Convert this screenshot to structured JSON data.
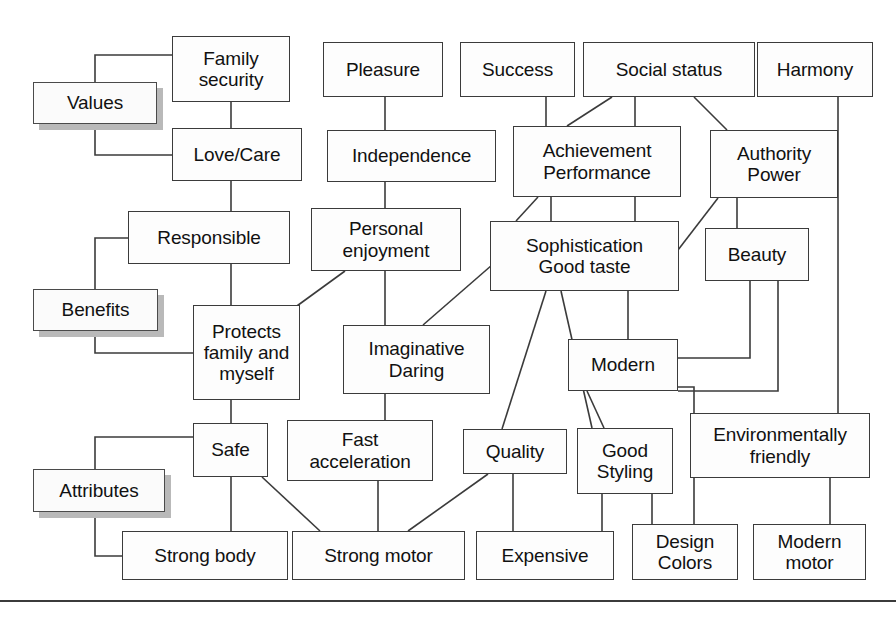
{
  "diagram": {
    "levels": [
      {
        "id": "values",
        "label": "Values",
        "x": 33,
        "y": 82,
        "w": 124,
        "h": 42
      },
      {
        "id": "benefits",
        "label": "Benefits",
        "x": 33,
        "y": 289,
        "w": 125,
        "h": 42
      },
      {
        "id": "attributes",
        "label": "Attributes",
        "x": 33,
        "y": 469,
        "w": 132,
        "h": 43
      }
    ],
    "nodes": [
      {
        "id": "family_security",
        "label": "Family\nsecurity",
        "x": 172,
        "y": 36,
        "w": 118,
        "h": 66
      },
      {
        "id": "pleasure",
        "label": "Pleasure",
        "x": 323,
        "y": 42,
        "w": 120,
        "h": 55
      },
      {
        "id": "success",
        "label": "Success",
        "x": 460,
        "y": 42,
        "w": 115,
        "h": 55
      },
      {
        "id": "social_status",
        "label": "Social status",
        "x": 583,
        "y": 42,
        "w": 172,
        "h": 55
      },
      {
        "id": "harmony",
        "label": "Harmony",
        "x": 757,
        "y": 42,
        "w": 116,
        "h": 55
      },
      {
        "id": "love_care",
        "label": "Love/Care",
        "x": 172,
        "y": 128,
        "w": 130,
        "h": 53
      },
      {
        "id": "independence",
        "label": "Independence",
        "x": 327,
        "y": 130,
        "w": 169,
        "h": 52
      },
      {
        "id": "achievement",
        "label": "Achievement\nPerformance",
        "x": 513,
        "y": 126,
        "w": 168,
        "h": 71
      },
      {
        "id": "authority",
        "label": "Authority\nPower",
        "x": 710,
        "y": 130,
        "w": 128,
        "h": 68
      },
      {
        "id": "responsible",
        "label": "Responsible",
        "x": 128,
        "y": 211,
        "w": 162,
        "h": 53
      },
      {
        "id": "personal_enjoyment",
        "label": "Personal\nenjoyment",
        "x": 311,
        "y": 208,
        "w": 150,
        "h": 63
      },
      {
        "id": "sophistication",
        "label": "Sophistication\nGood taste",
        "x": 490,
        "y": 221,
        "w": 189,
        "h": 70
      },
      {
        "id": "beauty",
        "label": "Beauty",
        "x": 705,
        "y": 228,
        "w": 104,
        "h": 53
      },
      {
        "id": "protects",
        "label": "Protects\nfamily and\nmyself",
        "x": 193,
        "y": 305,
        "w": 107,
        "h": 95
      },
      {
        "id": "imaginative",
        "label": "Imaginative\nDaring",
        "x": 343,
        "y": 325,
        "w": 147,
        "h": 69
      },
      {
        "id": "modern",
        "label": "Modern",
        "x": 568,
        "y": 339,
        "w": 110,
        "h": 52
      },
      {
        "id": "safe",
        "label": "Safe",
        "x": 193,
        "y": 423,
        "w": 75,
        "h": 54
      },
      {
        "id": "fast_acceleration",
        "label": "Fast\nacceleration",
        "x": 287,
        "y": 420,
        "w": 146,
        "h": 61
      },
      {
        "id": "quality",
        "label": "Quality",
        "x": 463,
        "y": 429,
        "w": 104,
        "h": 45
      },
      {
        "id": "good_styling",
        "label": "Good\nStyling",
        "x": 577,
        "y": 428,
        "w": 96,
        "h": 66
      },
      {
        "id": "environmentally_friendly",
        "label": "Environmentally\nfriendly",
        "x": 690,
        "y": 413,
        "w": 180,
        "h": 65
      },
      {
        "id": "strong_body",
        "label": "Strong body",
        "x": 122,
        "y": 531,
        "w": 166,
        "h": 49
      },
      {
        "id": "strong_motor",
        "label": "Strong motor",
        "x": 292,
        "y": 531,
        "w": 173,
        "h": 49
      },
      {
        "id": "expensive",
        "label": "Expensive",
        "x": 476,
        "y": 531,
        "w": 138,
        "h": 49
      },
      {
        "id": "design_colors",
        "label": "Design\nColors",
        "x": 632,
        "y": 524,
        "w": 106,
        "h": 56
      },
      {
        "id": "modern_motor",
        "label": "Modern\nmotor",
        "x": 753,
        "y": 524,
        "w": 113,
        "h": 56
      }
    ],
    "edges": [
      {
        "from": "values",
        "to": "family_security",
        "kind": "bracket"
      },
      {
        "from": "values",
        "to": "love_care",
        "kind": "bracket"
      },
      {
        "from": "family_security",
        "to": "love_care",
        "kind": "vertical"
      },
      {
        "from": "love_care",
        "to": "responsible",
        "kind": "vertical"
      },
      {
        "from": "benefits",
        "to": "responsible",
        "kind": "bracket"
      },
      {
        "from": "benefits",
        "to": "protects",
        "kind": "bracket"
      },
      {
        "from": "responsible",
        "to": "protects",
        "kind": "vertical"
      },
      {
        "from": "protects",
        "to": "safe",
        "kind": "vertical"
      },
      {
        "from": "attributes",
        "to": "safe",
        "kind": "bracket"
      },
      {
        "from": "attributes",
        "to": "strong_body",
        "kind": "bracket"
      },
      {
        "from": "safe",
        "to": "strong_body",
        "kind": "vertical"
      },
      {
        "from": "safe",
        "to": "strong_motor",
        "kind": "diagonal"
      },
      {
        "from": "pleasure",
        "to": "independence",
        "kind": "vertical"
      },
      {
        "from": "independence",
        "to": "personal_enjoyment",
        "kind": "vertical"
      },
      {
        "from": "personal_enjoyment",
        "to": "imaginative",
        "kind": "vertical"
      },
      {
        "from": "personal_enjoyment",
        "to": "protects",
        "kind": "diagonal"
      },
      {
        "from": "imaginative",
        "to": "fast_acceleration",
        "kind": "vertical"
      },
      {
        "from": "imaginative",
        "to": "sophistication",
        "kind": "diagonal"
      },
      {
        "from": "fast_acceleration",
        "to": "strong_motor",
        "kind": "vertical"
      },
      {
        "from": "success",
        "to": "achievement",
        "kind": "vertical"
      },
      {
        "from": "social_status",
        "to": "achievement",
        "kind": "diagonal"
      },
      {
        "from": "social_status",
        "to": "achievement",
        "kind": "vertical"
      },
      {
        "from": "social_status",
        "to": "authority",
        "kind": "diagonal"
      },
      {
        "from": "achievement",
        "to": "sophistication",
        "kind": "diagonal"
      },
      {
        "from": "achievement",
        "to": "sophistication",
        "kind": "vertical"
      },
      {
        "from": "authority",
        "to": "sophistication",
        "kind": "diagonal"
      },
      {
        "from": "authority",
        "to": "beauty",
        "kind": "vertical"
      },
      {
        "from": "sophistication",
        "to": "quality",
        "kind": "diagonal"
      },
      {
        "from": "sophistication",
        "to": "good_styling",
        "kind": "diagonal"
      },
      {
        "from": "sophistication",
        "to": "modern",
        "kind": "vertical"
      },
      {
        "from": "modern",
        "to": "good_styling",
        "kind": "diagonal"
      },
      {
        "from": "modern",
        "to": "design_colors",
        "kind": "orthogonal"
      },
      {
        "from": "modern",
        "to": "beauty",
        "kind": "orthogonal"
      },
      {
        "from": "quality",
        "to": "expensive",
        "kind": "vertical"
      },
      {
        "from": "quality",
        "to": "strong_motor",
        "kind": "diagonal"
      },
      {
        "from": "good_styling",
        "to": "expensive",
        "kind": "vertical"
      },
      {
        "from": "good_styling",
        "to": "design_colors",
        "kind": "vertical"
      },
      {
        "from": "harmony",
        "to": "environmentally_friendly",
        "kind": "orthogonal"
      },
      {
        "from": "environmentally_friendly",
        "to": "modern_motor",
        "kind": "vertical"
      }
    ],
    "colors": {
      "box_border": "#3b3b3b",
      "box_fill": "#fdfdfd",
      "shadow": "#b9b9b9",
      "line": "#3b3b3b",
      "text": "#111111"
    }
  }
}
